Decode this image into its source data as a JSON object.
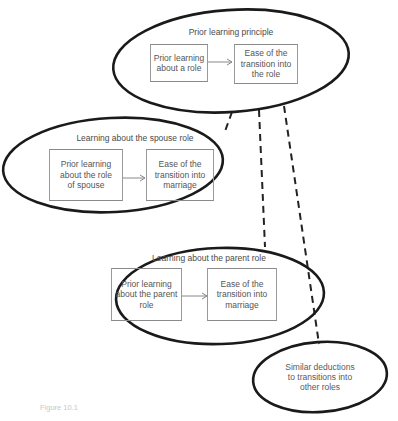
{
  "diagram": {
    "top_node": {
      "title": "Prior learning principle",
      "cause": "Prior learning about a role",
      "effect": "Ease of the transition into the role"
    },
    "spouse_node": {
      "title": "Learning about the spouse role",
      "cause": "Prior learning about the role of spouse",
      "effect": "Ease of the transition into marriage"
    },
    "parent_node": {
      "title": "Learning about the parent role",
      "cause": "Prior learning about the parent role",
      "effect": "Ease of the transition into marriage"
    },
    "other_node": {
      "text": "Similar deductions to transitions into other roles"
    },
    "caption": "Figure 10.1"
  }
}
